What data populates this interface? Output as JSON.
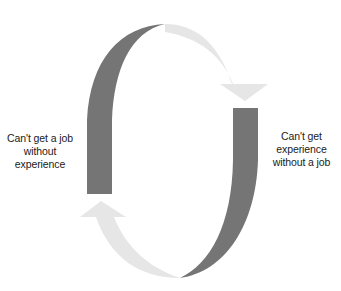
{
  "diagram": {
    "type": "cycle",
    "labels": {
      "left": "Can't get a job\nwithout\nexperience",
      "right": "Can't get\nexperience\nwithout a job"
    },
    "colors": {
      "dark_band": "#757575",
      "light_arrow": "#e6e6e6",
      "text": "#1a1a1a",
      "background": "#ffffff"
    },
    "nodes": [
      {
        "id": "left",
        "text": "Can't get a job without experience"
      },
      {
        "id": "right",
        "text": "Can't get experience without a job"
      }
    ],
    "edges": [
      {
        "from": "left",
        "to": "right",
        "direction": "clockwise-top"
      },
      {
        "from": "right",
        "to": "left",
        "direction": "clockwise-bottom"
      }
    ]
  }
}
